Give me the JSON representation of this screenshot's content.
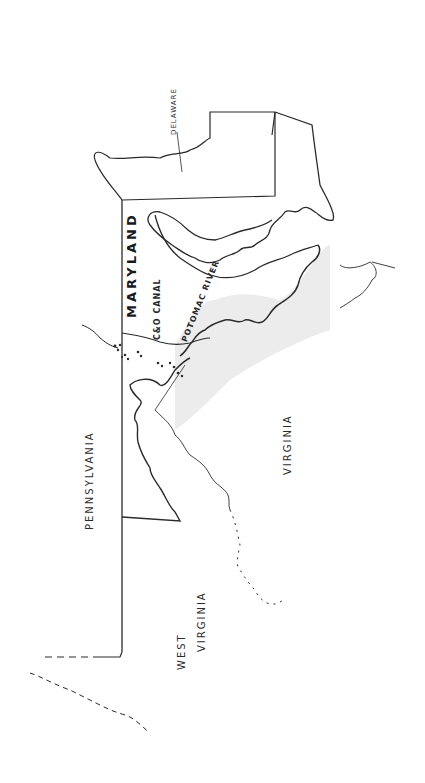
{
  "map": {
    "style": "hand-drawn pencil sketch, rotated 90 degrees counter-clockwise",
    "colors": {
      "ink": "#2a2a2a",
      "shade": "#d8d8d8",
      "background": "#ffffff"
    },
    "labels": {
      "maryland": "MARYLAND",
      "pennsylvania": "PENNSYLVANIA",
      "virginia": "VIRGINIA",
      "west_virginia_line1": "WEST",
      "west_virginia_line2": "VIRGINIA",
      "delaware": "DELAWARE",
      "canal": "C&O CANAL",
      "river": "POTOMAC RIVER"
    }
  }
}
